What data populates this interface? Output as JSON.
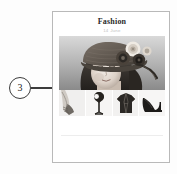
{
  "annotation": {
    "callout_number": "3",
    "callout_target": "hero-photo",
    "line_color": "#3c3c3c"
  },
  "page": {
    "title": "Fashion",
    "subtitle": "14 June",
    "background_color": "#ffffff",
    "border_color": "#b9b9b9"
  },
  "hero": {
    "alt": "Portrait of a woman wearing a knitted hat decorated with large fabric rosettes",
    "style": "grayscale"
  },
  "thumbnails": [
    {
      "alt": "Leg wearing a boot",
      "icon": "boot-thumbnail"
    },
    {
      "alt": "Fashion accessory on a stand",
      "icon": "accessory-thumbnail"
    },
    {
      "alt": "Dark coat",
      "icon": "coat-thumbnail"
    },
    {
      "alt": "Black high heel shoe",
      "icon": "high-heel-thumbnail"
    }
  ],
  "colors": {
    "canvas": "#fdfdfd",
    "title_text": "#2b2b2b",
    "subtitle_text": "#c2c2c2",
    "footer_rule": "#ededed"
  }
}
